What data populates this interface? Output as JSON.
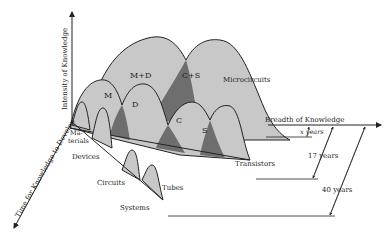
{
  "diagram": {
    "axes": {
      "vertical": "Intensity of Knowledge",
      "horizontal": "Breadth of Knowledge",
      "diagonal": "Time for Knowledge to Develop"
    },
    "levels": [
      {
        "name": "Materials",
        "label_line1": "Ma-",
        "label_line2": "terials"
      },
      {
        "name": "Devices",
        "label": "Devices"
      },
      {
        "name": "Circuits",
        "label": "Circuits"
      },
      {
        "name": "Systems",
        "label": "Systems"
      }
    ],
    "technologies": {
      "microcircuits": "Microcircuits",
      "transistors": "Transistors",
      "tubes": "Tubes"
    },
    "peak_labels": {
      "M": "M",
      "D": "D",
      "C": "C",
      "S": "S",
      "MD": "M+D",
      "CS": "C+S"
    },
    "time_spans": {
      "x": "x years",
      "seventeen": "17 years",
      "forty": "40 years"
    },
    "colors": {
      "fill_light": "#c8c8c8",
      "fill_dark": "#6e6e6e",
      "stroke": "#222222"
    }
  }
}
